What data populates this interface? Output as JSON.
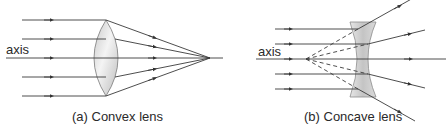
{
  "panels": [
    {
      "id": "a",
      "caption": "(a) Convex lens",
      "axis_label": "axis",
      "lens_type": "convex"
    },
    {
      "id": "b",
      "caption": "(b) Concave lens",
      "axis_label": "axis",
      "lens_type": "concave"
    }
  ],
  "colors": {
    "ray": "#3a3a3a",
    "lens_fill": "#d9d9d9",
    "lens_stroke": "#777777"
  }
}
